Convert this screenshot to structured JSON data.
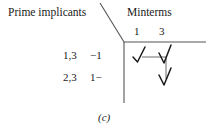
{
  "figure": {
    "caption": "(c)",
    "background_color": "#ffffff",
    "ink_color": "#1a1a1a",
    "rule_color": "#555555"
  },
  "headers": {
    "row_axis_label": "Prime implicants",
    "column_axis_label": "Minterms"
  },
  "columns": [
    {
      "label": "1"
    },
    {
      "label": "3"
    }
  ],
  "rows": [
    {
      "implicant": "1,3",
      "term": "−1"
    },
    {
      "implicant": "2,3",
      "term": "1−"
    }
  ],
  "marks": [
    {
      "row": 0,
      "column": 0,
      "glyph": "check"
    },
    {
      "row": 0,
      "column": 1,
      "glyph": "check"
    },
    {
      "row": 1,
      "column": 1,
      "glyph": "check"
    }
  ],
  "connectors": {
    "horizontal": {
      "note": "links mark at row 0 col 0 to mark at row 0 col 1"
    },
    "vertical": {
      "note": "drops from row 0 col 1 down to row 1 col 1"
    }
  }
}
